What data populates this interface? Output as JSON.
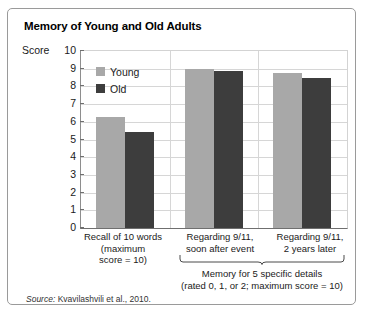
{
  "figure": {
    "title": "Memory of Young and Old Adults",
    "y_axis_title": "Score",
    "source_label": "Source:",
    "source_text": "Kvavilashvili et al., 2010.",
    "group_caption_line1": "Memory for 5 specific details",
    "group_caption_line2": "(rated 0, 1, or 2; maximum score = 10)",
    "brace_icon": "curly-brace-icon",
    "frame_border_color": "#9a9a9a"
  },
  "chart_data": {
    "type": "bar",
    "title": "Memory of Young and Old Adults",
    "xlabel": "",
    "ylabel": "Score",
    "ylim": [
      0,
      10
    ],
    "yticks": [
      0,
      1,
      2,
      3,
      4,
      5,
      6,
      7,
      8,
      9,
      10
    ],
    "ytick_labels": [
      "0",
      "1",
      "2",
      "3",
      "4",
      "5",
      "6",
      "7",
      "8",
      "9",
      "10"
    ],
    "grid": true,
    "legend_position": "upper-left-inside",
    "categories": [
      "Recall of 10 words (maximum score = 10)",
      "Regarding 9/11, soon after event",
      "Regarding 9/11, 2 years later"
    ],
    "category_label_lines": [
      [
        "Recall of 10 words",
        "(maximum",
        "score = 10)"
      ],
      [
        "Regarding 9/11,",
        "soon after event"
      ],
      [
        "Regarding 9/11,",
        "2 years later"
      ]
    ],
    "series": [
      {
        "name": "Young",
        "color": "#a8a8a8",
        "values": [
          6.3,
          9.0,
          8.75
        ]
      },
      {
        "name": "Old",
        "color": "#3d3d3d",
        "values": [
          5.4,
          8.85,
          8.5
        ]
      }
    ],
    "annotations": [
      "Memory for 5 specific details",
      "(rated 0, 1, or 2; maximum score = 10)"
    ]
  }
}
